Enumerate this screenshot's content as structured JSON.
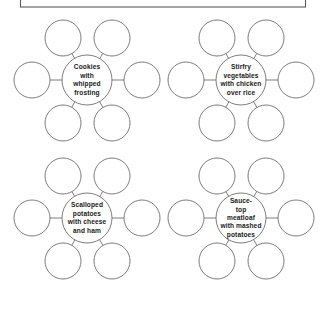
{
  "page": {
    "background_color": "#ffffff",
    "width": 327,
    "height": 309
  },
  "header_box": {
    "name": "title-box",
    "text": "",
    "border_color": "#5a5a5a"
  },
  "style": {
    "circle_stroke": "#6e6e6e",
    "text_color": "#1a1a1a",
    "satellite_count": 6
  },
  "clusters": [
    {
      "id": "cluster-cookies",
      "center": {
        "cx": 87,
        "cy": 80,
        "r": 25
      },
      "lines": [
        "Cookies",
        "with",
        "whipped",
        "frosting"
      ],
      "satellite_r": 18,
      "satellites": [
        {
          "name": "satellite-top-left",
          "cx": 63,
          "cy": 38,
          "label": ""
        },
        {
          "name": "satellite-top-right",
          "cx": 112,
          "cy": 38,
          "label": ""
        },
        {
          "name": "satellite-left",
          "cx": 32,
          "cy": 80,
          "label": ""
        },
        {
          "name": "satellite-right",
          "cx": 142,
          "cy": 80,
          "label": ""
        },
        {
          "name": "satellite-bottom-left",
          "cx": 63,
          "cy": 123,
          "label": ""
        },
        {
          "name": "satellite-bottom-right",
          "cx": 112,
          "cy": 123,
          "label": ""
        }
      ]
    },
    {
      "id": "cluster-stirfry",
      "center": {
        "cx": 241,
        "cy": 80,
        "r": 25
      },
      "lines": [
        "Stirfry",
        "vegetables",
        "with chicken",
        "over rice"
      ],
      "satellite_r": 18,
      "satellites": [
        {
          "name": "satellite-top-left",
          "cx": 217,
          "cy": 38,
          "label": ""
        },
        {
          "name": "satellite-top-right",
          "cx": 266,
          "cy": 38,
          "label": ""
        },
        {
          "name": "satellite-left",
          "cx": 186,
          "cy": 80,
          "label": ""
        },
        {
          "name": "satellite-right",
          "cx": 296,
          "cy": 80,
          "label": ""
        },
        {
          "name": "satellite-bottom-left",
          "cx": 217,
          "cy": 123,
          "label": ""
        },
        {
          "name": "satellite-bottom-right",
          "cx": 266,
          "cy": 123,
          "label": ""
        }
      ]
    },
    {
      "id": "cluster-scalloped-potatoes",
      "center": {
        "cx": 87,
        "cy": 218,
        "r": 25
      },
      "lines": [
        "Scalloped",
        "potatoes",
        "with cheese",
        "and ham"
      ],
      "satellite_r": 18,
      "satellites": [
        {
          "name": "satellite-top-left",
          "cx": 63,
          "cy": 176,
          "label": ""
        },
        {
          "name": "satellite-top-right",
          "cx": 112,
          "cy": 176,
          "label": ""
        },
        {
          "name": "satellite-left",
          "cx": 32,
          "cy": 218,
          "label": ""
        },
        {
          "name": "satellite-right",
          "cx": 142,
          "cy": 218,
          "label": ""
        },
        {
          "name": "satellite-bottom-left",
          "cx": 63,
          "cy": 261,
          "label": ""
        },
        {
          "name": "satellite-bottom-right",
          "cx": 112,
          "cy": 261,
          "label": ""
        }
      ]
    },
    {
      "id": "cluster-meatloaf",
      "center": {
        "cx": 241,
        "cy": 218,
        "r": 25
      },
      "lines": [
        "Sauce-",
        "top",
        "meatloaf",
        "with mashed",
        "potatoes"
      ],
      "satellite_r": 18,
      "satellites": [
        {
          "name": "satellite-top-left",
          "cx": 217,
          "cy": 176,
          "label": ""
        },
        {
          "name": "satellite-top-right",
          "cx": 266,
          "cy": 176,
          "label": ""
        },
        {
          "name": "satellite-left",
          "cx": 186,
          "cy": 218,
          "label": ""
        },
        {
          "name": "satellite-right",
          "cx": 296,
          "cy": 218,
          "label": ""
        },
        {
          "name": "satellite-bottom-left",
          "cx": 217,
          "cy": 261,
          "label": ""
        },
        {
          "name": "satellite-bottom-right",
          "cx": 266,
          "cy": 261,
          "label": ""
        }
      ]
    }
  ]
}
